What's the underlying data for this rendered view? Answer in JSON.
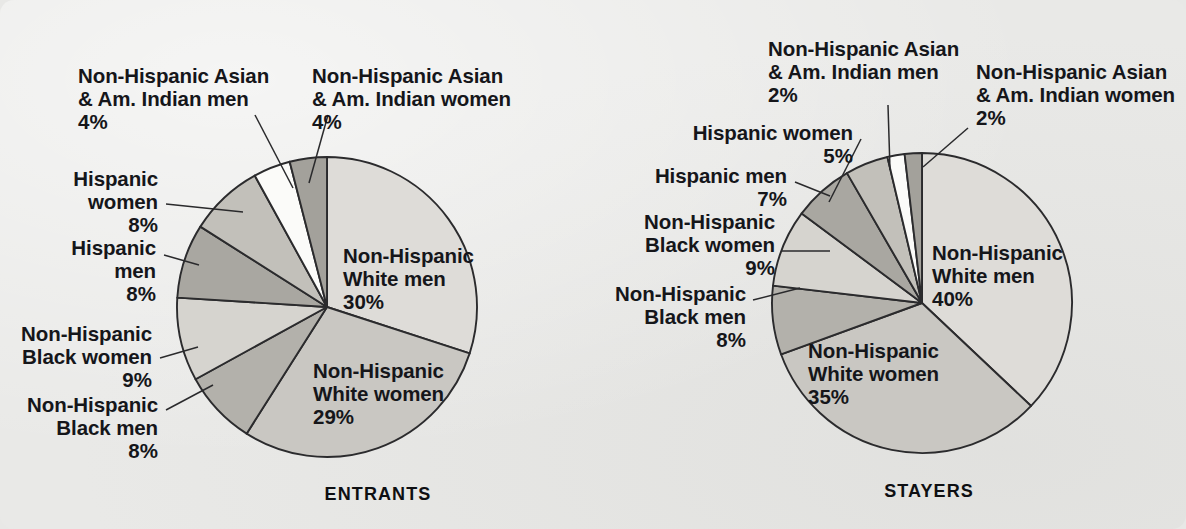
{
  "page": {
    "background_color": "#e9e9e7",
    "text_color": "#15161a",
    "outline_color": "#2b2b2d"
  },
  "charts": [
    {
      "id": "entrants",
      "caption": "ENTRANTS",
      "center": {
        "x": 327,
        "y": 307
      },
      "radius": 150,
      "labels": {
        "asian_men": "Non-Hispanic Asian",
        "asian_men2": "& Am. Indian men",
        "asian_men_pct": "4%",
        "asian_women": "Non-Hispanic Asian",
        "asian_women2": "& Am. Indian women",
        "asian_women_pct": "4%",
        "hisp_women": "Hispanic",
        "hisp_women2": "women",
        "hisp_women_pct": "8%",
        "hisp_men": "Hispanic",
        "hisp_men2": "men",
        "hisp_men_pct": "8%",
        "black_women": "Non-Hispanic",
        "black_women2": "Black women",
        "black_women_pct": "9%",
        "black_men": "Non-Hispanic",
        "black_men2": "Black men",
        "black_men_pct": "8%",
        "white_men": "Non-Hispanic",
        "white_men2": "White men",
        "white_men_pct": "30%",
        "white_women": "Non-Hispanic",
        "white_women2": "White women",
        "white_women_pct": "29%"
      }
    },
    {
      "id": "stayers",
      "caption": "STAYERS",
      "center": {
        "x": 922,
        "y": 303
      },
      "radius": 150,
      "labels": {
        "asian_men": "Non-Hispanic Asian",
        "asian_men2": "& Am. Indian men",
        "asian_men_pct": "2%",
        "asian_women": "Non-Hispanic Asian",
        "asian_women2": "& Am. Indian women",
        "asian_women_pct": "2%",
        "hisp_women": "Hispanic women",
        "hisp_women_pct": "5%",
        "hisp_men": "Hispanic men",
        "hisp_men_pct": "7%",
        "black_women": "Non-Hispanic",
        "black_women2": "Black women",
        "black_women_pct": "9%",
        "black_men": "Non-Hispanic",
        "black_men2": "Black men",
        "black_men_pct": "8%",
        "white_men": "Non-Hispanic",
        "white_men2": "White men",
        "white_men_pct": "40%",
        "white_women": "Non-Hispanic",
        "white_women2": "White women",
        "white_women_pct": "35%"
      }
    }
  ],
  "chart_data": [
    {
      "type": "pie",
      "title": "ENTRANTS",
      "categories": [
        "Non-Hispanic White men",
        "Non-Hispanic White women",
        "Non-Hispanic Black men",
        "Non-Hispanic Black women",
        "Hispanic men",
        "Hispanic women",
        "Non-Hispanic Asian & Am. Indian men",
        "Non-Hispanic Asian & Am. Indian women"
      ],
      "values": [
        30,
        29,
        8,
        9,
        8,
        8,
        4,
        4
      ],
      "units": "percent",
      "labels": [
        "30%",
        "29%",
        "8%",
        "9%",
        "8%",
        "8%",
        "4%",
        "4%"
      ],
      "colors": [
        "#dedcd8",
        "#c9c7c2",
        "#b3b1ab",
        "#d6d4cf",
        "#a9a7a1",
        "#c2c0ba",
        "#fbfbf9",
        "#a3a19b"
      ],
      "start_angle_deg": 0,
      "direction": "clockwise",
      "legend": "none",
      "grid": false
    },
    {
      "type": "pie",
      "title": "STAYERS",
      "categories": [
        "Non-Hispanic White men",
        "Non-Hispanic White women",
        "Non-Hispanic Black men",
        "Non-Hispanic Black women",
        "Hispanic men",
        "Hispanic women",
        "Non-Hispanic Asian & Am. Indian men",
        "Non-Hispanic Asian & Am. Indian women"
      ],
      "values": [
        40,
        35,
        8,
        9,
        7,
        5,
        2,
        2
      ],
      "units": "percent",
      "labels": [
        "40%",
        "35%",
        "8%",
        "9%",
        "7%",
        "5%",
        "2%",
        "2%"
      ],
      "colors": [
        "#dedcd8",
        "#c9c7c2",
        "#b3b1ab",
        "#d6d4cf",
        "#a9a7a1",
        "#c2c0ba",
        "#fbfbf9",
        "#a3a19b"
      ],
      "start_angle_deg": 0,
      "direction": "clockwise",
      "legend": "none",
      "grid": false
    }
  ]
}
